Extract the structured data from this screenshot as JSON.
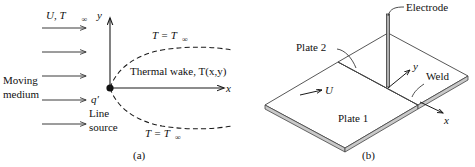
{
  "figure": {
    "title_a": "(a)",
    "title_b": "(b)"
  },
  "panel_a": {
    "name": "line-source-thermal-wake-schematic",
    "axis_y_label": "y",
    "axis_x_label": "x",
    "freestream_label": "U, T",
    "freestream_sub": "∞",
    "medium_line1": "Moving",
    "medium_line2": "medium",
    "source_label": "q′",
    "source_line1": "Line",
    "source_line2": "source",
    "wake_label": "Thermal wake, T(x,y)",
    "temp_top_label": "T = T",
    "temp_top_sub": "∞",
    "temp_bottom_label": "T = T",
    "temp_bottom_sub": "∞",
    "arrow_count": 5
  },
  "panel_b": {
    "name": "welded-plates-electrode-schematic",
    "electrode_label": "Electrode",
    "plate2_label": "Plate 2",
    "plate1_label": "Plate 1",
    "weld_label": "Weld",
    "velocity_label": "U",
    "axis_y_label": "y",
    "axis_x_label": "x"
  },
  "colors": {
    "ink": "#111111",
    "line": "#1a1a1a",
    "plate_edge": "#c9c9c9",
    "electrode": "#b0b0b0",
    "background": "#ffffff"
  }
}
